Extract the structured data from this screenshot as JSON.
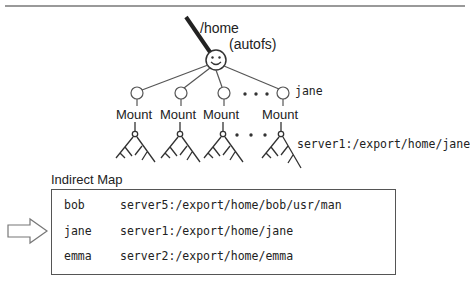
{
  "diagram": {
    "root_path": "/home",
    "root_type": "(autofs)",
    "mount_label": "Mount",
    "leaf_user": "jane",
    "leaf_source": "server1:/export/home/jane"
  },
  "indirect_map": {
    "title": "Indirect Map",
    "rows": [
      {
        "key": "bob",
        "location": "server5:/export/home/bob/usr/man"
      },
      {
        "key": "jane",
        "location": "server1:/export/home/jane"
      },
      {
        "key": "emma",
        "location": "server2:/export/home/emma"
      }
    ]
  }
}
